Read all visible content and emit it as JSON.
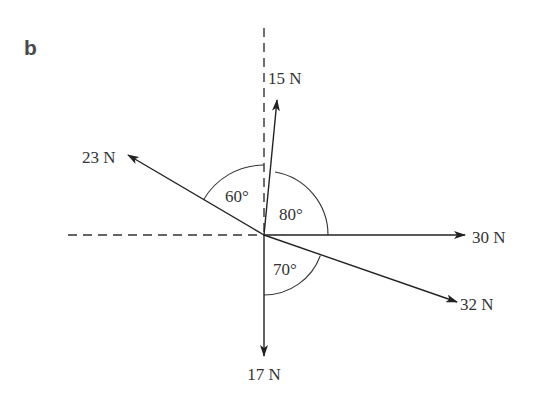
{
  "panel_label": "b",
  "top_clip_text": "",
  "colors": {
    "line": "#333333",
    "text": "#333333",
    "panel_label": "#4a4a4a",
    "background": "#ffffff"
  },
  "origin": {
    "x": 264,
    "y": 235
  },
  "axes": {
    "horizontal_dashed": {
      "from_x": 68,
      "to_x": 264,
      "y": 235
    },
    "vertical_dashed": {
      "x": 264,
      "from_y": 28,
      "to_y": 235
    }
  },
  "forces": [
    {
      "id": "f15",
      "label": "15 N",
      "tip": [
        277,
        100
      ],
      "label_pos": [
        268,
        84
      ]
    },
    {
      "id": "f23",
      "label": "23 N",
      "tip": [
        128,
        155
      ],
      "label_pos": [
        82,
        163
      ]
    },
    {
      "id": "f30",
      "label": "30 N",
      "tip": [
        465,
        235
      ],
      "label_pos": [
        472,
        243
      ]
    },
    {
      "id": "f32",
      "label": "32 N",
      "tip": [
        457,
        302
      ],
      "label_pos": [
        460,
        310
      ]
    },
    {
      "id": "f17",
      "label": "17 N",
      "tip": [
        264,
        356
      ],
      "label_pos": [
        264,
        380
      ]
    }
  ],
  "angles": [
    {
      "id": "a60",
      "label": "60°",
      "label_pos": [
        225,
        202
      ]
    },
    {
      "id": "a80",
      "label": "80°",
      "label_pos": [
        279,
        220
      ]
    },
    {
      "id": "a70",
      "label": "70°",
      "label_pos": [
        273,
        275
      ]
    }
  ]
}
